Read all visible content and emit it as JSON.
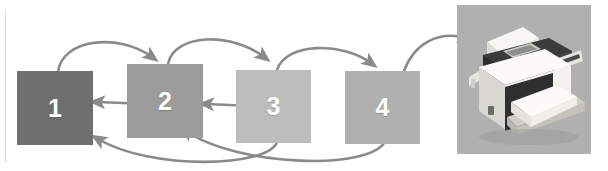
{
  "diagram": {
    "background_color": "#ffffff",
    "stages": [
      {
        "label": "1",
        "color": "#6f6f6f",
        "name": "stage-1"
      },
      {
        "label": "2",
        "color": "#9b9b9b",
        "name": "stage-2"
      },
      {
        "label": "3",
        "color": "#bcbcbc",
        "name": "stage-3"
      },
      {
        "label": "4",
        "color": "#b0b0b0",
        "name": "stage-4"
      }
    ],
    "arrow_color": "#8a8a8a",
    "connectors": [
      {
        "name": "arc-1-to-2",
        "from": "1",
        "to": "2",
        "direction": "forward",
        "style": "arc-over"
      },
      {
        "name": "arc-2-to-3",
        "from": "2",
        "to": "3",
        "direction": "forward",
        "style": "arc-over"
      },
      {
        "name": "arc-3-to-4",
        "from": "3",
        "to": "4",
        "direction": "forward",
        "style": "arc-over"
      },
      {
        "name": "arc-4-to-printer",
        "from": "4",
        "to": "printer",
        "direction": "forward",
        "style": "arc-over"
      },
      {
        "name": "return-2-to-1",
        "from": "2",
        "to": "1",
        "direction": "backward",
        "style": "straight"
      },
      {
        "name": "return-3-to-2",
        "from": "3",
        "to": "2",
        "direction": "backward",
        "style": "straight"
      },
      {
        "name": "return-3-to-1",
        "from": "3",
        "to": "1",
        "direction": "backward",
        "style": "long-curve-under"
      },
      {
        "name": "return-4-to-2",
        "from": "4",
        "to": "2",
        "direction": "backward",
        "style": "long-curve-under"
      }
    ],
    "printer": {
      "name": "printer-photo",
      "caption": "",
      "panel_color": "#b0b0b0",
      "body_color": "#f2f0ec",
      "top_color": "#3a3a3a",
      "paper_color": "#fbfbf9"
    }
  }
}
